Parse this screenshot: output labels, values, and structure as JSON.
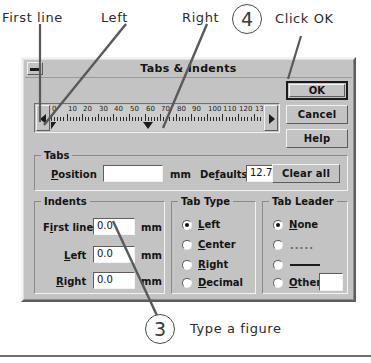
{
  "dialog": {
    "title": "Tabs & Indents",
    "sysmenu_icon": "minimize-box-icon"
  },
  "buttons": {
    "ok": "OK",
    "cancel": "Cancel",
    "help": "Help",
    "clear_all": "Clear all"
  },
  "ruler": {
    "unit": "mm",
    "labels": [
      "0",
      "10",
      "20",
      "30",
      "40",
      "50",
      "60",
      "70",
      "80",
      "90",
      "100",
      "110",
      "120",
      "130"
    ],
    "values": [
      0,
      10,
      20,
      30,
      40,
      50,
      60,
      70,
      80,
      90,
      100,
      110,
      120,
      130
    ],
    "markers": [
      {
        "name": "first-line-indent-marker",
        "value": 0
      },
      {
        "name": "left-indent-marker",
        "value": 0
      },
      {
        "name": "right-indent-marker",
        "value": 62
      }
    ],
    "scroll_left_icon": "triangle-left-icon",
    "scroll_right_icon": "triangle-right-icon"
  },
  "tabs_group": {
    "title": "Tabs",
    "position_label": "Position",
    "position_value": "",
    "position_unit": "mm",
    "defaults_label": "Defaults",
    "defaults_value": "12.7",
    "spinner_icon": "spinner-updown-icon"
  },
  "indents_group": {
    "title": "Indents",
    "unit": "mm",
    "fields": [
      {
        "label": "First line",
        "value": "0.0"
      },
      {
        "label": "Left",
        "value": "0.0"
      },
      {
        "label": "Right",
        "value": "0.0"
      }
    ]
  },
  "tab_type_group": {
    "title": "Tab Type",
    "selected": "Left",
    "options": [
      {
        "label": "Left",
        "selected": true
      },
      {
        "label": "Center",
        "selected": false
      },
      {
        "label": "Right",
        "selected": false
      },
      {
        "label": "Decimal",
        "selected": false
      }
    ]
  },
  "tab_leader_group": {
    "title": "Tab Leader",
    "selected": "None",
    "options": [
      {
        "label": "None",
        "selected": true,
        "style": "text"
      },
      {
        "label": ".....",
        "selected": false,
        "style": "dotted"
      },
      {
        "label": "",
        "selected": false,
        "style": "solid"
      },
      {
        "label": "Other",
        "selected": false,
        "style": "text"
      }
    ],
    "other_value": ""
  },
  "annotations": {
    "labels": [
      {
        "text": "First line",
        "name": "annotation-first-line"
      },
      {
        "text": "Left",
        "name": "annotation-left"
      },
      {
        "text": "Right",
        "name": "annotation-right"
      }
    ],
    "steps": [
      {
        "number": "4",
        "text": "Click OK"
      },
      {
        "number": "3",
        "text": "Type a figure"
      }
    ]
  },
  "colors": {
    "face": "#c3c3c3",
    "shadow": "#5d5d5d",
    "highlight": "#f2f2f2",
    "text": "#141414",
    "field": "#ffffff",
    "annotation": "#3a3a3a"
  }
}
